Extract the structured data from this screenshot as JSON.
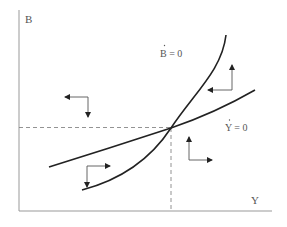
{
  "diagram": {
    "type": "phase-diagram",
    "axes": {
      "x_label": "Y",
      "y_label": "B"
    },
    "curves": [
      {
        "id": "b-dot-zero",
        "label": "Ḃ = 0",
        "label_text": "B = 0",
        "shape": "convex upward-sloping"
      },
      {
        "id": "y-dot-zero",
        "label": "Ẏ = 0",
        "label_text": "Y = 0",
        "shape": "gently upward-sloping"
      }
    ],
    "steady_state": {
      "marked_by": "dashed reference lines"
    },
    "direction_arrows": [
      {
        "region": "upper-left",
        "horizontal": "left",
        "vertical": "down"
      },
      {
        "region": "upper-right",
        "horizontal": "left",
        "vertical": "up"
      },
      {
        "region": "lower-right",
        "horizontal": "right",
        "vertical": "up"
      },
      {
        "region": "lower-left",
        "horizontal": "right",
        "vertical": "down"
      }
    ],
    "colors": {
      "axis": "#888888",
      "curve": "#222222",
      "arrow": "#555555",
      "dashed": "#777777",
      "text": "#555555"
    }
  }
}
